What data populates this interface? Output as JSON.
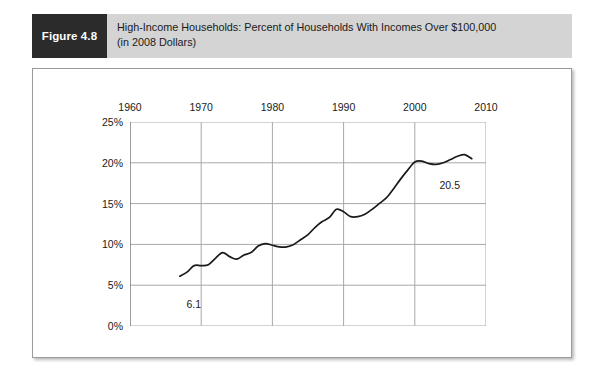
{
  "figure": {
    "tag": "Figure 4.8",
    "caption_line1": "High-Income Households: Percent of Households With Incomes Over $100,000",
    "caption_line2": "(in 2008 Dollars)"
  },
  "colors": {
    "tag_background": "#2b2b2b",
    "header_background": "#d4d4d4",
    "line": "#1a1a1a",
    "grid": "#a8a8a8",
    "axis": "#6e6e6e",
    "text": "#1a1a1a",
    "panel_background": "#ffffff"
  },
  "chart_data": {
    "type": "line",
    "title": "High-Income Households: Percent of Households With Incomes Over $100,000 (in 2008 Dollars)",
    "xlabel": "",
    "ylabel": "",
    "xlim": [
      1960,
      2010
    ],
    "ylim": [
      0,
      25
    ],
    "grid": true,
    "legend": "none",
    "x_axis_position": "top",
    "xticks": [
      1960,
      1970,
      1980,
      1990,
      2000,
      2010
    ],
    "xtick_labels": [
      "1960",
      "1970",
      "1980",
      "1990",
      "2000",
      "2010"
    ],
    "yticks": [
      0,
      5,
      10,
      15,
      20,
      25
    ],
    "ytick_labels": [
      "0%",
      "5%",
      "10%",
      "15%",
      "20%",
      "25%"
    ],
    "series": [
      {
        "name": "Percent of households with incomes over $100,000 (2008 dollars)",
        "x": [
          1967,
          1968,
          1969,
          1970,
          1971,
          1972,
          1973,
          1974,
          1975,
          1976,
          1977,
          1978,
          1979,
          1980,
          1981,
          1982,
          1983,
          1984,
          1985,
          1986,
          1987,
          1988,
          1989,
          1990,
          1991,
          1992,
          1993,
          1994,
          1995,
          1996,
          1997,
          1998,
          1999,
          2000,
          2001,
          2002,
          2003,
          2004,
          2005,
          2006,
          2007,
          2008
        ],
        "values": [
          6.1,
          6.6,
          7.4,
          7.4,
          7.5,
          8.3,
          9.0,
          8.5,
          8.2,
          8.7,
          9.0,
          9.8,
          10.1,
          9.9,
          9.7,
          9.7,
          10.0,
          10.6,
          11.2,
          12.1,
          12.8,
          13.3,
          14.3,
          14.0,
          13.4,
          13.4,
          13.7,
          14.3,
          15.0,
          15.7,
          16.8,
          18.0,
          19.1,
          20.1,
          20.2,
          19.9,
          19.8,
          20.0,
          20.4,
          20.8,
          21.0,
          20.5
        ]
      }
    ],
    "annotations": [
      {
        "label": "6.1",
        "x": 1967,
        "y": 6.1,
        "placement": "below-right"
      },
      {
        "label": "20.5",
        "x": 2008,
        "y": 20.5,
        "placement": "below-left"
      }
    ]
  }
}
